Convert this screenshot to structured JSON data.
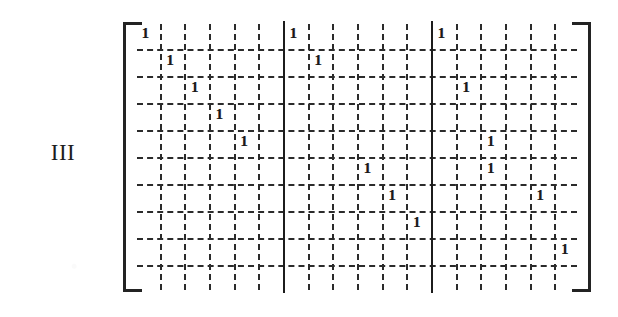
{
  "figure": {
    "label": "III",
    "caption": ""
  },
  "matrix": {
    "rows": 10,
    "columns": 18,
    "block_columns": [
      6,
      6,
      6
    ],
    "block_separator_count": 2,
    "bracket_style": "square",
    "grid_line_style": "dashed",
    "separator_line_style": "solid",
    "entry_value": "1",
    "entries": [
      {
        "row": 1,
        "col": 1,
        "value": "1"
      },
      {
        "row": 1,
        "col": 7,
        "value": "1"
      },
      {
        "row": 1,
        "col": 13,
        "value": "1"
      },
      {
        "row": 2,
        "col": 2,
        "value": "1"
      },
      {
        "row": 2,
        "col": 8,
        "value": "1"
      },
      {
        "row": 3,
        "col": 3,
        "value": "1"
      },
      {
        "row": 3,
        "col": 14,
        "value": "1"
      },
      {
        "row": 4,
        "col": 4,
        "value": "1"
      },
      {
        "row": 5,
        "col": 5,
        "value": "1"
      },
      {
        "row": 5,
        "col": 15,
        "value": "1"
      },
      {
        "row": 6,
        "col": 10,
        "value": "1"
      },
      {
        "row": 6,
        "col": 15,
        "value": "1"
      },
      {
        "row": 7,
        "col": 11,
        "value": "1"
      },
      {
        "row": 7,
        "col": 17,
        "value": "1"
      },
      {
        "row": 8,
        "col": 12,
        "value": "1"
      },
      {
        "row": 9,
        "col": 18,
        "value": "1"
      }
    ]
  },
  "colors": {
    "ink": "#1a1a1a",
    "grid": "#2b2b2b",
    "separator": "#1c1c1c",
    "paper": "#ffffff"
  }
}
